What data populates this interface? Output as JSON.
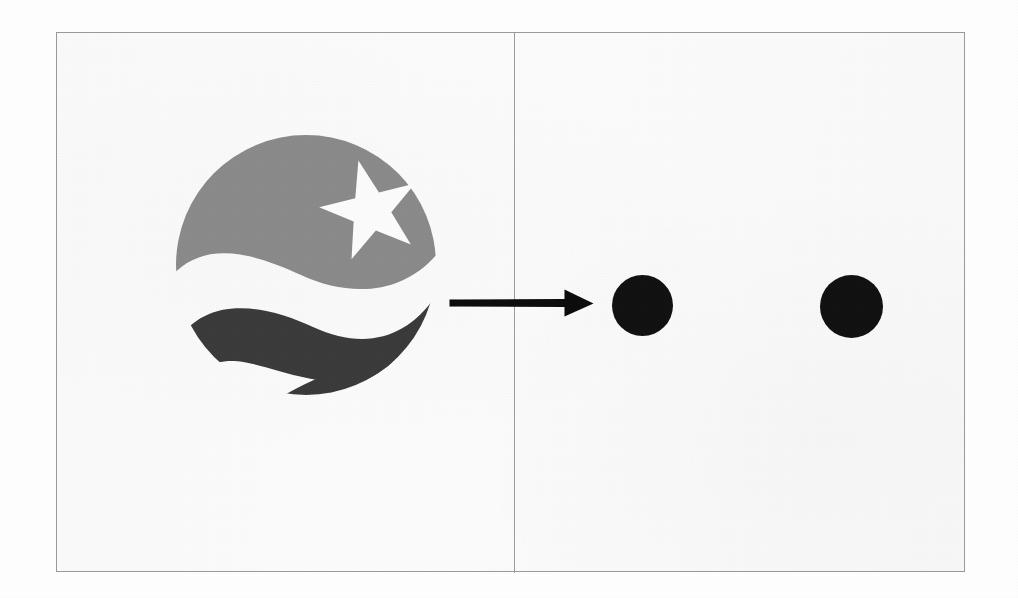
{
  "page": {
    "background_color": "#ffffff"
  },
  "figure": {
    "frame": {
      "border_color": "#9a9a9a",
      "fill_color": "#fbfbfb",
      "x": 56,
      "y": 32,
      "width": 909,
      "height": 540
    },
    "divider": {
      "name": "vertical-panel-divider",
      "color": "#9c9c9c",
      "x": 513,
      "orientation": "vertical"
    },
    "left_panel": {
      "label": "source emblem panel",
      "content": "circular agency emblem with star and two waves"
    },
    "right_panel": {
      "label": "result dots panel",
      "content": "two solid black circles"
    }
  },
  "logo": {
    "name": "agency-emblem",
    "description": "Circular emblem: gray dome with white five-pointed star, dark wave band and dark crescent swoosh below",
    "colors": {
      "dome_gray": "#8a8a8a",
      "star_white": "#fbfbfb",
      "wave_dark": "#3a3a3a",
      "swoosh_dark": "#3a3a3a"
    },
    "center_x": 290,
    "center_y": 280,
    "radius": 130
  },
  "arrow": {
    "name": "rightward-transform-arrow",
    "color": "#0d0d0d",
    "direction": "right",
    "start_x": 447,
    "end_x": 582,
    "y": 302,
    "shaft_thickness": 7,
    "crosses_divider": true
  },
  "dots": {
    "color": "#121212",
    "count": 2,
    "items": [
      {
        "name": "output-dot-1",
        "center_x": 641,
        "center_y": 304,
        "diameter": 61
      },
      {
        "name": "output-dot-2",
        "center_x": 850,
        "center_y": 305,
        "diameter": 63
      }
    ]
  }
}
